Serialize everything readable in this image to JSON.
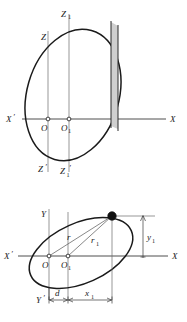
{
  "figure": {
    "background_color": "#ffffff",
    "width": 187,
    "height": 322,
    "ink_color": "#1a1a1a",
    "shade_color": "#cfcfcf"
  },
  "upper_view": {
    "name": "elevation-xz-view",
    "axes": {
      "horizontal_left_label": "X",
      "horizontal_left_prime": "′",
      "horizontal_right_label": "X",
      "vertical_top_label_1": "Z",
      "vertical_top_label_2": "Z",
      "vertical_top_sub_2": "1",
      "vertical_bottom_label_1": "Z",
      "vertical_bottom_prime_1": "′",
      "vertical_bottom_label_2": "Z",
      "vertical_bottom_sub_2": "1",
      "vertical_bottom_prime_2": "′"
    },
    "origins": [
      {
        "label": "O",
        "sub": ""
      },
      {
        "label": "O",
        "sub": "1"
      }
    ],
    "element": {
      "name": "shaded-strip",
      "description": "narrow vertical shaded strip near right edge of disc"
    }
  },
  "lower_view": {
    "name": "plan-xy-view",
    "axes": {
      "horizontal_left_label": "X",
      "horizontal_left_prime": "′",
      "horizontal_right_label": "X",
      "vertical_top_label": "Y",
      "vertical_bottom_label": "Y",
      "vertical_bottom_prime": "′"
    },
    "origins": [
      {
        "label": "O",
        "sub": ""
      },
      {
        "label": "O",
        "sub": "1"
      }
    ],
    "radii": [
      {
        "label": "r",
        "sub": "",
        "from": "O",
        "to": "point"
      },
      {
        "label": "r",
        "sub": "1",
        "from": "O1",
        "to": "point"
      }
    ],
    "dimensions": [
      {
        "label": "d",
        "sub": "",
        "orientation": "horizontal"
      },
      {
        "label": "x",
        "sub": "1",
        "orientation": "horizontal"
      },
      {
        "label": "y",
        "sub": "1",
        "orientation": "vertical"
      }
    ],
    "point": {
      "name": "mass-point",
      "style": "filled-circle"
    }
  }
}
